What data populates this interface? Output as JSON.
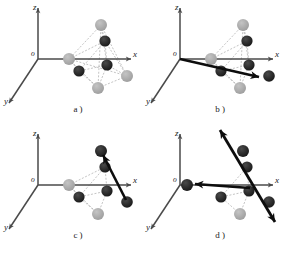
{
  "figure": {
    "background_color": "#ffffff",
    "width": 284,
    "height": 253,
    "panels": [
      {
        "id": "a",
        "caption": "a )",
        "caption_x": 78,
        "caption_y": 112,
        "origin_x": 38,
        "origin_y": 59,
        "origin_label": "o",
        "axes": [
          {
            "name": "z",
            "label": "z",
            "tip_x": 38,
            "tip_y": 8,
            "label_x": 33,
            "label_y": 10
          },
          {
            "name": "x",
            "label": "x",
            "tip_x": 131,
            "tip_y": 59,
            "label_x": 133,
            "label_y": 57
          },
          {
            "name": "y",
            "label": "y",
            "tip_x": 9,
            "tip_y": 103,
            "label_x": 4,
            "label_y": 104
          }
        ],
        "atoms": [
          {
            "name": "gray-top",
            "cx": 101,
            "cy": 25,
            "r": 6.0,
            "color": "#9a9a9a"
          },
          {
            "name": "gray-left",
            "cx": 69,
            "cy": 59,
            "r": 6.0,
            "color": "#9a9a9a"
          },
          {
            "name": "gray-bottom",
            "cx": 98,
            "cy": 88,
            "r": 6.0,
            "color": "#9a9a9a"
          },
          {
            "name": "gray-right",
            "cx": 127,
            "cy": 76,
            "r": 6.0,
            "color": "#9a9a9a"
          },
          {
            "name": "black-upper",
            "cx": 105,
            "cy": 41,
            "r": 5.6,
            "color": "#131313"
          },
          {
            "name": "black-mid",
            "cx": 107,
            "cy": 65,
            "r": 5.6,
            "color": "#131313"
          },
          {
            "name": "black-lower",
            "cx": 79,
            "cy": 71,
            "r": 5.6,
            "color": "#131313"
          }
        ],
        "arrows": []
      },
      {
        "id": "b",
        "caption": "b )",
        "caption_x": 220,
        "caption_y": 112,
        "origin_x": 180,
        "origin_y": 59,
        "origin_label": "o",
        "axes": [
          {
            "name": "z",
            "label": "z",
            "tip_x": 180,
            "tip_y": 8,
            "label_x": 175,
            "label_y": 10
          },
          {
            "name": "x",
            "label": "x",
            "tip_x": 273,
            "tip_y": 59,
            "label_x": 275,
            "label_y": 57
          },
          {
            "name": "y",
            "label": "y",
            "tip_x": 151,
            "tip_y": 103,
            "label_x": 146,
            "label_y": 104
          }
        ],
        "atoms": [
          {
            "name": "gray-top",
            "cx": 243,
            "cy": 25,
            "r": 6.0,
            "color": "#9a9a9a"
          },
          {
            "name": "gray-left",
            "cx": 211,
            "cy": 59,
            "r": 6.0,
            "color": "#9a9a9a"
          },
          {
            "name": "gray-bottom",
            "cx": 240,
            "cy": 88,
            "r": 6.0,
            "color": "#9a9a9a"
          },
          {
            "name": "black-right",
            "cx": 269,
            "cy": 76,
            "r": 5.8,
            "color": "#131313"
          },
          {
            "name": "black-upper",
            "cx": 247,
            "cy": 41,
            "r": 5.6,
            "color": "#131313"
          },
          {
            "name": "black-mid",
            "cx": 249,
            "cy": 65,
            "r": 5.6,
            "color": "#131313"
          },
          {
            "name": "black-lower",
            "cx": 221,
            "cy": 71,
            "r": 5.6,
            "color": "#131313"
          }
        ],
        "arrows": [
          {
            "name": "displacement-arrow",
            "x1": 180,
            "y1": 59,
            "x2": 259,
            "y2": 77,
            "double": false,
            "width": 2.6,
            "color": "#0d0d0d"
          }
        ]
      },
      {
        "id": "c",
        "caption": "c )",
        "caption_x": 78,
        "caption_y": 238,
        "origin_x": 38,
        "origin_y": 185,
        "origin_label": "o",
        "axes": [
          {
            "name": "z",
            "label": "z",
            "tip_x": 38,
            "tip_y": 134,
            "label_x": 33,
            "label_y": 136
          },
          {
            "name": "x",
            "label": "x",
            "tip_x": 131,
            "tip_y": 185,
            "label_x": 133,
            "label_y": 183
          },
          {
            "name": "y",
            "label": "y",
            "tip_x": 9,
            "tip_y": 229,
            "label_x": 4,
            "label_y": 230
          }
        ],
        "atoms": [
          {
            "name": "black-top",
            "cx": 101,
            "cy": 151,
            "r": 6.0,
            "color": "#131313"
          },
          {
            "name": "gray-left",
            "cx": 69,
            "cy": 185,
            "r": 6.0,
            "color": "#9a9a9a"
          },
          {
            "name": "gray-bottom",
            "cx": 98,
            "cy": 214,
            "r": 6.0,
            "color": "#9a9a9a"
          },
          {
            "name": "black-right",
            "cx": 127,
            "cy": 202,
            "r": 5.8,
            "color": "#131313"
          },
          {
            "name": "black-upper",
            "cx": 105,
            "cy": 167,
            "r": 5.6,
            "color": "#131313"
          },
          {
            "name": "black-mid",
            "cx": 107,
            "cy": 191,
            "r": 5.6,
            "color": "#131313"
          },
          {
            "name": "black-lower",
            "cx": 79,
            "cy": 197,
            "r": 5.6,
            "color": "#131313"
          }
        ],
        "arrows": [
          {
            "name": "displacement-arrow",
            "x1": 126,
            "y1": 200,
            "x2": 103,
            "y2": 155,
            "double": false,
            "width": 2.6,
            "color": "#0d0d0d"
          }
        ]
      },
      {
        "id": "d",
        "caption": "d )",
        "caption_x": 220,
        "caption_y": 238,
        "origin_x": 180,
        "origin_y": 185,
        "origin_label": "o",
        "axes": [
          {
            "name": "z",
            "label": "z",
            "tip_x": 180,
            "tip_y": 134,
            "label_x": 175,
            "label_y": 136
          },
          {
            "name": "x",
            "label": "x",
            "tip_x": 273,
            "tip_y": 185,
            "label_x": 275,
            "label_y": 183
          },
          {
            "name": "y",
            "label": "y",
            "tip_x": 151,
            "tip_y": 229,
            "label_x": 146,
            "label_y": 230
          }
        ],
        "atoms": [
          {
            "name": "black-top",
            "cx": 243,
            "cy": 151,
            "r": 6.0,
            "color": "#131313"
          },
          {
            "name": "black-origin",
            "cx": 187,
            "cy": 185,
            "r": 6.0,
            "color": "#131313"
          },
          {
            "name": "gray-bottom",
            "cx": 240,
            "cy": 214,
            "r": 6.0,
            "color": "#9a9a9a"
          },
          {
            "name": "black-right",
            "cx": 269,
            "cy": 202,
            "r": 5.8,
            "color": "#131313"
          },
          {
            "name": "black-upper",
            "cx": 247,
            "cy": 167,
            "r": 5.6,
            "color": "#131313"
          },
          {
            "name": "black-mid",
            "cx": 249,
            "cy": 191,
            "r": 5.6,
            "color": "#131313"
          },
          {
            "name": "black-lower",
            "cx": 221,
            "cy": 197,
            "r": 5.6,
            "color": "#131313"
          }
        ],
        "arrows": [
          {
            "name": "shear-arrow-diagonal",
            "x1": 220,
            "y1": 130,
            "x2": 275,
            "y2": 222,
            "double": true,
            "width": 2.8,
            "color": "#0d0d0d"
          },
          {
            "name": "displacement-arrow-left",
            "x1": 250,
            "y1": 188,
            "x2": 195,
            "y2": 184,
            "double": false,
            "width": 2.6,
            "color": "#0d0d0d"
          }
        ]
      }
    ],
    "cluster_edges": [
      [
        "gray-top",
        "gray-left"
      ],
      [
        "gray-top",
        "gray-right"
      ],
      [
        "gray-top",
        "gray-bottom"
      ],
      [
        "gray-left",
        "gray-bottom"
      ],
      [
        "gray-left",
        "gray-right"
      ],
      [
        "gray-bottom",
        "gray-right"
      ],
      [
        "gray-top",
        "black-upper"
      ],
      [
        "gray-top",
        "black-mid"
      ],
      [
        "gray-left",
        "black-lower"
      ],
      [
        "gray-left",
        "black-upper"
      ],
      [
        "gray-bottom",
        "black-lower"
      ],
      [
        "gray-bottom",
        "black-mid"
      ],
      [
        "gray-right",
        "black-mid"
      ],
      [
        "gray-right",
        "black-upper"
      ],
      [
        "black-upper",
        "black-mid"
      ],
      [
        "black-mid",
        "black-lower"
      ],
      [
        "black-lower",
        "black-upper"
      ]
    ],
    "style": {
      "axis_color": "#4a4a4a",
      "bond_color": "#b5b5b5",
      "gray_atom_color": "#9a9a9a",
      "black_atom_color": "#131313",
      "arrow_color": "#0d0d0d"
    }
  }
}
